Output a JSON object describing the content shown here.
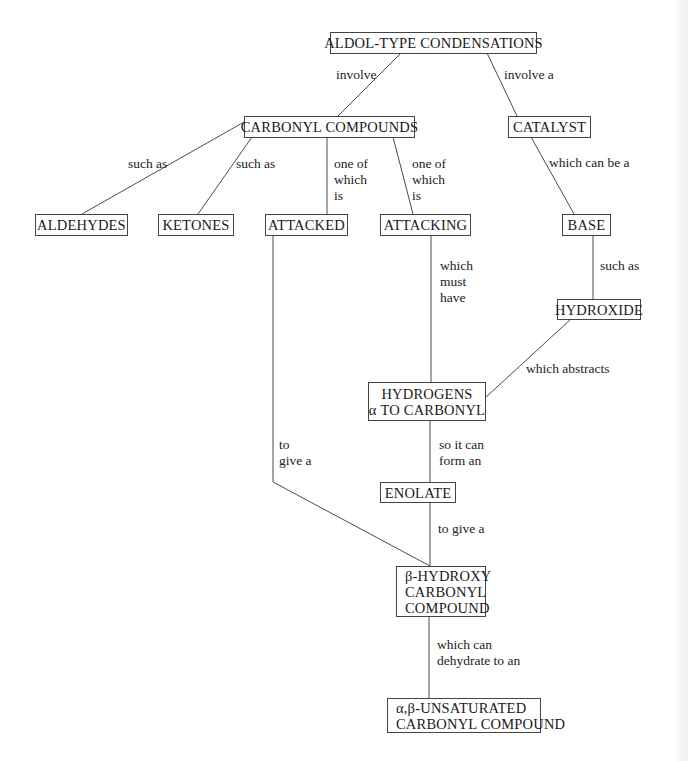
{
  "diagram": {
    "type": "concept-map",
    "header_fragment": "˙ ˙ .˙ ˙",
    "nodes": {
      "aldol": {
        "label": "ALDOL-TYPE CONDENSATIONS"
      },
      "carbonyl_compounds": {
        "label": "CARBONYL COMPOUNDS"
      },
      "catalyst": {
        "label": "CATALYST"
      },
      "aldehydes": {
        "label": "ALDEHYDES"
      },
      "ketones": {
        "label": "KETONES"
      },
      "attacked": {
        "label": "ATTACKED"
      },
      "attacking": {
        "label": "ATTACKING"
      },
      "base": {
        "label": "BASE"
      },
      "hydroxide": {
        "label": "HYDROXIDE"
      },
      "hydrogens": {
        "lines": [
          "HYDROGENS",
          "α TO CARBONYL"
        ]
      },
      "enolate": {
        "label": "ENOLATE"
      },
      "beta_hydroxy": {
        "lines": [
          "β-HYDROXY",
          "CARBONYL",
          "COMPOUND"
        ]
      },
      "unsaturated": {
        "lines": [
          "α,β-UNSATURATED",
          "CARBONYL COMPOUND"
        ]
      }
    },
    "links": {
      "aldol_carbonyl": {
        "lines": [
          "involve"
        ]
      },
      "aldol_catalyst": {
        "lines": [
          "involve a"
        ]
      },
      "carbonyl_aldehydes": {
        "lines": [
          "such as"
        ]
      },
      "carbonyl_ketones": {
        "lines": [
          "such as"
        ]
      },
      "carbonyl_attacked": {
        "lines": [
          "one of",
          "which",
          "is"
        ]
      },
      "carbonyl_attacking": {
        "lines": [
          "one of",
          "which",
          "is"
        ]
      },
      "catalyst_base": {
        "lines": [
          "which can be a"
        ]
      },
      "base_hydroxide": {
        "lines": [
          "such as"
        ]
      },
      "attacking_hydrogens": {
        "lines": [
          "which",
          "must",
          "have"
        ]
      },
      "hydroxide_hydrogens": {
        "lines": [
          "which abstracts"
        ]
      },
      "hydrogens_enolate": {
        "lines": [
          "so it can",
          "form an"
        ]
      },
      "attacked_betahydroxy": {
        "lines": [
          "to",
          "give a"
        ]
      },
      "enolate_betahydroxy": {
        "lines": [
          "to give a"
        ]
      },
      "betahydroxy_unsaturated": {
        "lines": [
          "which can",
          "dehydrate to an"
        ]
      }
    },
    "colors": {
      "line": "#4a4a4a",
      "border": "#444444",
      "text": "#1a1a1a",
      "background": "#ffffff"
    }
  }
}
